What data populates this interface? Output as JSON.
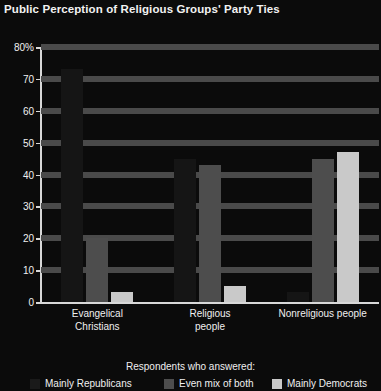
{
  "chart_data": {
    "type": "bar",
    "title": "Public Perception of Religious Groups' Party Ties",
    "xlabel": "",
    "ylabel": "",
    "ylim": [
      0,
      80
    ],
    "yticks": [
      "0",
      "10",
      "20",
      "30",
      "40",
      "50",
      "60",
      "70",
      "80%"
    ],
    "ytick_values": [
      0,
      10,
      20,
      30,
      40,
      50,
      60,
      70,
      80
    ],
    "grid": true,
    "legend_position": "bottom",
    "legend_title": "Respondents who answered:",
    "categories": [
      "Evangelical Christians",
      "Religious people",
      "Nonreligious people"
    ],
    "category_lines": [
      [
        "Evangelical",
        "Christians"
      ],
      [
        "Religious",
        "people"
      ],
      [
        "Nonreligious people"
      ]
    ],
    "series": [
      {
        "name": "Mainly Republicans",
        "color": "#151515",
        "values": [
          73,
          45,
          3
        ]
      },
      {
        "name": "Even mix of both",
        "color": "#4d4d4d",
        "values": [
          20,
          43,
          45
        ]
      },
      {
        "name": "Mainly Democrats",
        "color": "#c9c9c9",
        "values": [
          3,
          5,
          47
        ]
      }
    ]
  }
}
